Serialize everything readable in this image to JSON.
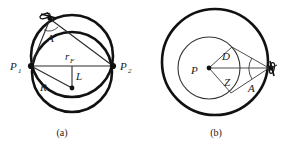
{
  "figure": {
    "background_color": "#ffffff",
    "ink_color": "#111111",
    "width": 294,
    "height": 144,
    "panels": [
      {
        "id": "panel-a",
        "caption": "(a)",
        "description": "Two overlapping circles (lens/oval outline) with baseline P1-P2, radius R to circle center, perpendicular offset L, and angle A at the satellite apex",
        "labels": [
          {
            "name": "label-p1",
            "text": "P",
            "sub": "1",
            "x": 12,
            "y": 69
          },
          {
            "name": "label-p2",
            "text": "P",
            "sub": "2",
            "x": 121,
            "y": 69
          },
          {
            "name": "label-rf",
            "text": "r",
            "sub": "F",
            "x": 66,
            "y": 59
          },
          {
            "name": "label-L",
            "text": "L",
            "sub": "",
            "x": 74,
            "y": 78
          },
          {
            "name": "label-R",
            "text": "R",
            "sub": "",
            "x": 40,
            "y": 88
          },
          {
            "name": "label-A",
            "text": "A",
            "sub": "",
            "x": 49,
            "y": 40
          }
        ],
        "icons": [
          {
            "name": "satellite-icon",
            "x": 48,
            "y": 16
          }
        ]
      },
      {
        "id": "panel-b",
        "caption": "(b)",
        "description": "Concentric circles: thick outer circle and thin inner circle centered at P, with chord sector D and Z and tangent rays converging to satellite at right forming angle A",
        "labels": [
          {
            "name": "label-P",
            "text": "P",
            "sub": "",
            "x": 192,
            "y": 74
          },
          {
            "name": "label-D",
            "text": "D",
            "sub": "",
            "x": 224,
            "y": 60
          },
          {
            "name": "label-Z",
            "text": "Z",
            "sub": "",
            "x": 226,
            "y": 84
          },
          {
            "name": "label-A-b",
            "text": "A",
            "sub": "",
            "x": 250,
            "y": 90
          }
        ],
        "icons": [
          {
            "name": "satellite-icon",
            "x": 271,
            "y": 67
          }
        ]
      }
    ],
    "captions": [
      {
        "name": "caption-a",
        "text": "(a)",
        "x": 62,
        "y": 134
      },
      {
        "name": "caption-b",
        "text": "(b)",
        "x": 216,
        "y": 134
      }
    ]
  }
}
